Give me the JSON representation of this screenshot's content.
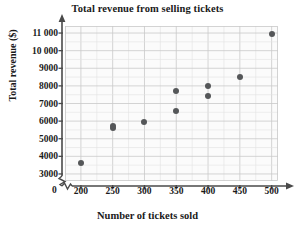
{
  "chart_data": {
    "type": "scatter",
    "title": "Total revenue from selling tickets",
    "xlabel": "Number of tickets sold",
    "ylabel": "Total revenue ($)",
    "xlim": [
      175,
      510
    ],
    "ylim": [
      2600,
      11400
    ],
    "grid": true,
    "minor_grid": true,
    "legend": "none",
    "axis_break_x": true,
    "axis_break_y": true,
    "origin_label": "0",
    "x_ticks": [
      200,
      250,
      300,
      350,
      400,
      450,
      500
    ],
    "x_tick_labels": [
      "200",
      "250",
      "300",
      "350",
      "400",
      "450",
      "500"
    ],
    "y_ticks": [
      3000,
      4000,
      5000,
      6000,
      7000,
      8000,
      9000,
      10000,
      11000
    ],
    "y_tick_labels": [
      "3000",
      "4000",
      "5000",
      "6000",
      "7000",
      "8000",
      "9000",
      "10 000",
      "11 000"
    ],
    "x": [
      200,
      250,
      250,
      300,
      350,
      350,
      400,
      400,
      450,
      500
    ],
    "y": [
      3600,
      5600,
      5750,
      5950,
      6600,
      7700,
      7450,
      8000,
      8500,
      10950
    ],
    "points": [
      {
        "x": 200,
        "y": 3600
      },
      {
        "x": 250,
        "y": 5600
      },
      {
        "x": 250,
        "y": 5750
      },
      {
        "x": 300,
        "y": 5950
      },
      {
        "x": 350,
        "y": 6600
      },
      {
        "x": 350,
        "y": 7700
      },
      {
        "x": 400,
        "y": 7450
      },
      {
        "x": 400,
        "y": 8000
      },
      {
        "x": 450,
        "y": 8500
      },
      {
        "x": 500,
        "y": 10950
      }
    ],
    "marker_color": "#555759",
    "grid_color": "#d4d4d4",
    "axis_color": "#4a4a4a",
    "background": "#ffffff"
  }
}
